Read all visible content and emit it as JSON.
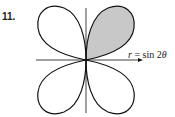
{
  "problem_number": "11.",
  "equation": {
    "var": "r",
    "eq": " = sin 2",
    "theta": "θ"
  },
  "colors": {
    "stroke": "#111111",
    "shaded_petal": "#c8c8c8"
  },
  "figure": {
    "type": "polar rose",
    "petals": 4,
    "shaded_petal": "first quadrant"
  }
}
